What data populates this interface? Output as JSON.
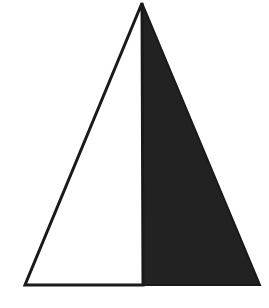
{
  "diagram": {
    "shape": "triangle",
    "colors": {
      "background": "#ffffff",
      "outline": "#1a1a1a",
      "fill": "#222222"
    },
    "points": {
      "apex": [
        142,
        3
      ],
      "bottom_left": [
        25,
        285
      ],
      "bottom_right": [
        260,
        285
      ],
      "split_bottom": [
        143,
        285
      ]
    }
  }
}
